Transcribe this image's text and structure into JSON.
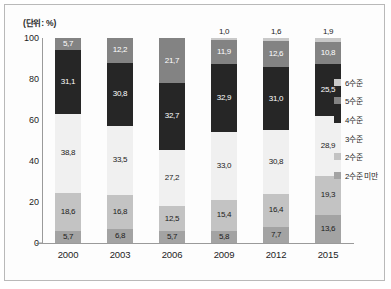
{
  "chart_data": {
    "type": "bar",
    "subtype": "stacked-100-percent",
    "title": "",
    "unit_caption": "(단위: %)",
    "xlabel": "",
    "ylabel": "",
    "categories": [
      "2000",
      "2003",
      "2006",
      "2009",
      "2012",
      "2015"
    ],
    "ylim": [
      0,
      100
    ],
    "ytick_labels": [
      "0",
      "20",
      "40",
      "60",
      "80",
      "100"
    ],
    "ytick_values": [
      0,
      20,
      40,
      60,
      80,
      100
    ],
    "grid": false,
    "legend_position": "right",
    "legend_entries": [
      "6수준",
      "5수준",
      "4수준",
      "3수준",
      "2수준",
      "2수준 미만"
    ],
    "colors": {
      "level6": "#c9c9c9",
      "level5": "#838383",
      "level4": "#262626",
      "level3": "#f0f0f0",
      "level2": "#c3c3c3",
      "below_level2": "#a3a3a3",
      "frame_border": "#b9b9b9",
      "axis_line": "#9a9a9a",
      "background": "#fdfdfd"
    },
    "series": [
      {
        "name": "6수준",
        "color_key": "level6",
        "values": [
          null,
          null,
          null,
          1.0,
          1.6,
          1.9
        ],
        "labels": [
          "",
          "",
          "",
          "1,0",
          "1,6",
          "1,9"
        ],
        "label_text_color": "dark",
        "label_placement": [
          "none",
          "none",
          "none",
          "outside-top",
          "outside-top",
          "outside-top"
        ]
      },
      {
        "name": "5수준",
        "color_key": "level5",
        "values": [
          5.7,
          12.2,
          21.7,
          11.9,
          12.6,
          10.8
        ],
        "labels": [
          "5,7",
          "12,2",
          "21,7",
          "11,9",
          "12,6",
          "10,8"
        ],
        "label_text_color": "light",
        "label_placement": [
          "inside",
          "inside",
          "inside",
          "inside",
          "inside",
          "inside"
        ]
      },
      {
        "name": "4수준",
        "color_key": "level4",
        "values": [
          31.1,
          30.8,
          32.7,
          32.9,
          31.0,
          25.5
        ],
        "labels": [
          "31,1",
          "30,8",
          "32,7",
          "32,9",
          "31,0",
          "25,5"
        ],
        "label_text_color": "light",
        "label_placement": [
          "inside",
          "inside",
          "inside",
          "inside",
          "inside",
          "inside"
        ]
      },
      {
        "name": "3수준",
        "color_key": "level3",
        "values": [
          38.8,
          33.5,
          27.2,
          33.0,
          30.8,
          28.9
        ],
        "labels": [
          "38,8",
          "33,5",
          "27,2",
          "33,0",
          "30,8",
          "28,9"
        ],
        "label_text_color": "dark",
        "label_placement": [
          "inside",
          "inside",
          "inside",
          "inside",
          "inside",
          "inside"
        ]
      },
      {
        "name": "2수준",
        "color_key": "level2",
        "values": [
          18.6,
          16.8,
          12.5,
          15.4,
          16.4,
          19.3
        ],
        "labels": [
          "18,6",
          "16,8",
          "12,5",
          "15,4",
          "16,4",
          "19,3"
        ],
        "label_text_color": "dark",
        "label_placement": [
          "inside",
          "inside",
          "inside",
          "inside",
          "inside",
          "inside"
        ]
      },
      {
        "name": "2수준 미만",
        "color_key": "below_level2",
        "values": [
          5.7,
          6.8,
          5.7,
          5.8,
          7.7,
          13.6
        ],
        "labels": [
          "5,7",
          "6,8",
          "5,7",
          "5,8",
          "7,7",
          "13,6"
        ],
        "label_text_color": "dark",
        "label_placement": [
          "inside",
          "inside",
          "inside",
          "inside",
          "inside",
          "inside"
        ]
      }
    ]
  }
}
